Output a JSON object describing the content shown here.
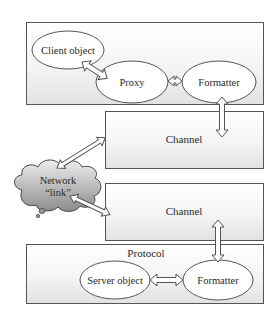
{
  "diagram": {
    "boxes": {
      "client_box": {
        "label": ""
      },
      "channel_top": {
        "label": "Channel"
      },
      "channel_bottom": {
        "label": "Channel"
      },
      "protocol_box": {
        "label": "Protocol"
      }
    },
    "nodes": {
      "client_object": "Client object",
      "proxy": "Proxy",
      "formatter_client": "Formatter",
      "server_object": "Server object",
      "formatter_server": "Formatter"
    },
    "cloud": {
      "line1": "Network",
      "line2": "“link”"
    },
    "edges": [
      {
        "from": "Client object",
        "to": "Proxy",
        "type": "bidirectional"
      },
      {
        "from": "Proxy",
        "to": "Formatter",
        "type": "bidirectional"
      },
      {
        "from": "Formatter",
        "to": "Channel",
        "type": "bidirectional"
      },
      {
        "from": "Channel",
        "to": "Network link",
        "type": "bidirectional"
      },
      {
        "from": "Network link",
        "to": "Channel",
        "type": "bidirectional"
      },
      {
        "from": "Channel",
        "to": "Formatter",
        "type": "bidirectional"
      },
      {
        "from": "Server object",
        "to": "Formatter",
        "type": "bidirectional"
      }
    ],
    "colors": {
      "stroke": "#555555",
      "box_fill_top": "#ffffff",
      "box_fill_bottom": "#e4e4e4",
      "cloud_light": "#e8e8e8",
      "cloud_dark": "#8a8a8a"
    }
  }
}
